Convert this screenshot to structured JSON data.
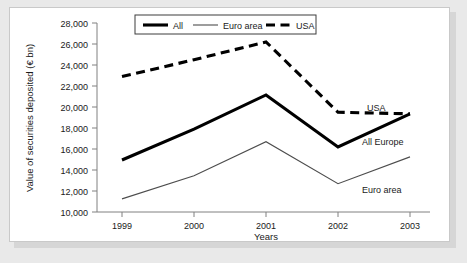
{
  "chart_data": {
    "type": "line",
    "title": "",
    "xlabel": "Years",
    "ylabel": "Value of securities deposited (€ bn)",
    "categories": [
      "1999",
      "2000",
      "2001",
      "2002",
      "2003"
    ],
    "x": [
      1999,
      2000,
      2001,
      2002,
      2003
    ],
    "ylim": [
      10000,
      28000
    ],
    "ytick_labels": [
      "10,000",
      "12,000",
      "14,000",
      "16,000",
      "18,000",
      "20,000",
      "22,000",
      "24,000",
      "26,000",
      "28,000"
    ],
    "ytick_values": [
      10000,
      12000,
      14000,
      16000,
      18000,
      20000,
      22000,
      24000,
      26000,
      28000
    ],
    "grid": false,
    "legend_position": "top-center-inside",
    "series": [
      {
        "name": "All",
        "legend_label": "All",
        "annotation_label": "All Europe",
        "style": "solid-thick",
        "color": "#000000",
        "values": [
          14950,
          17900,
          21150,
          16200,
          19350
        ]
      },
      {
        "name": "Euro area",
        "legend_label": "Euro area",
        "annotation_label": "Euro area",
        "style": "solid-thin",
        "color": "#4d4d4d",
        "values": [
          11250,
          13450,
          16700,
          12700,
          15250
        ]
      },
      {
        "name": "USA",
        "legend_label": "USA",
        "annotation_label": "USA",
        "style": "dashed-thick",
        "color": "#000000",
        "values": [
          22900,
          24500,
          26200,
          19500,
          19350
        ]
      }
    ]
  },
  "legend": {
    "entries": [
      "All",
      "Euro area",
      "USA"
    ]
  },
  "annotations": {
    "usa": "USA",
    "all_europe": "All Europe",
    "euro_area": "Euro area"
  },
  "colors": {
    "panel_background": "#ffffff",
    "figure_background": "#e9e9e9",
    "axis": "#808080",
    "series_all": "#000000",
    "series_euro": "#4d4d4d",
    "series_usa": "#000000",
    "text": "#1a1a1a"
  }
}
